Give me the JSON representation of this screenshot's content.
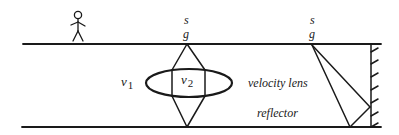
{
  "diagram": {
    "type": "seismic-model-cross-section",
    "labels": {
      "source_center": "s",
      "receiver_center": "g",
      "source_right": "s",
      "receiver_right": "g",
      "v1": "v",
      "v1_sub": "1",
      "v2": "v",
      "v2_sub": "2",
      "velocity_lens": "velocity lens",
      "reflector": "reflector"
    },
    "elements": [
      "person-icon",
      "surface-line",
      "reflector-line",
      "velocity-lens-ellipse",
      "diamond-raypaths",
      "vertical-reflector-wall",
      "triangle-raypath"
    ],
    "colors": {
      "ink": "#1a1a1a",
      "background": "#ffffff"
    }
  }
}
